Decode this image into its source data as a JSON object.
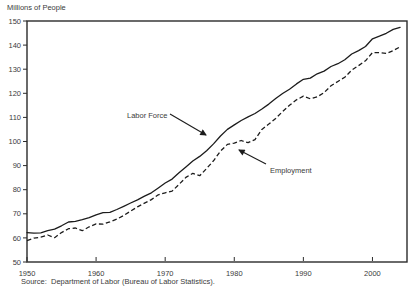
{
  "chart_data": {
    "type": "line",
    "title": "",
    "ylabel": "Millions of People",
    "xlabel": "",
    "xlim": [
      1950,
      2005
    ],
    "ylim": [
      50,
      150
    ],
    "x_ticks": [
      1950,
      1960,
      1970,
      1980,
      1990,
      2000
    ],
    "y_ticks": [
      50,
      60,
      70,
      80,
      90,
      100,
      110,
      120,
      130,
      140,
      150
    ],
    "grid": false,
    "legend_position": "inline-annotations",
    "x": [
      1950,
      1951,
      1952,
      1953,
      1954,
      1955,
      1956,
      1957,
      1958,
      1959,
      1960,
      1961,
      1962,
      1963,
      1964,
      1965,
      1966,
      1967,
      1968,
      1969,
      1970,
      1971,
      1972,
      1973,
      1974,
      1975,
      1976,
      1977,
      1978,
      1979,
      1980,
      1981,
      1982,
      1983,
      1984,
      1985,
      1986,
      1987,
      1988,
      1989,
      1990,
      1991,
      1992,
      1993,
      1994,
      1995,
      1996,
      1997,
      1998,
      1999,
      2000,
      2001,
      2002,
      2003,
      2004
    ],
    "series": [
      {
        "name": "Labor Force",
        "style": "solid",
        "color": "#1c1c1c",
        "values": [
          62.2,
          62.0,
          62.1,
          63.0,
          63.6,
          65.0,
          66.6,
          66.9,
          67.6,
          68.4,
          69.6,
          70.5,
          70.6,
          71.8,
          73.1,
          74.5,
          75.8,
          77.3,
          78.7,
          80.7,
          82.8,
          84.4,
          87.0,
          89.4,
          91.9,
          93.8,
          96.2,
          99.0,
          102.3,
          105.0,
          106.9,
          108.7,
          110.2,
          111.6,
          113.5,
          115.5,
          117.8,
          119.9,
          121.7,
          123.9,
          125.8,
          126.3,
          128.1,
          129.2,
          131.1,
          132.3,
          133.9,
          136.3,
          137.7,
          139.4,
          142.6,
          143.7,
          144.9,
          146.5,
          147.4
        ]
      },
      {
        "name": "Employment",
        "style": "dashed",
        "color": "#1c1c1c",
        "values": [
          58.9,
          59.9,
          60.3,
          61.2,
          60.1,
          62.2,
          63.8,
          64.1,
          63.0,
          64.6,
          65.8,
          65.7,
          66.7,
          67.8,
          69.3,
          71.1,
          72.9,
          74.4,
          75.9,
          77.9,
          78.7,
          79.4,
          82.2,
          85.1,
          86.8,
          85.8,
          88.8,
          92.0,
          96.0,
          98.8,
          99.3,
          100.4,
          99.5,
          100.8,
          105.0,
          107.2,
          109.6,
          112.4,
          115.0,
          117.3,
          118.8,
          117.7,
          118.5,
          120.3,
          123.1,
          124.9,
          126.7,
          129.6,
          131.5,
          133.5,
          136.9,
          136.9,
          136.5,
          137.7,
          139.3
        ]
      }
    ],
    "annotations": [
      {
        "label": "Labor Force"
      },
      {
        "label": "Employment"
      }
    ],
    "source_note": "Source:  Department of Labor (Bureau of Labor Statistics)."
  }
}
